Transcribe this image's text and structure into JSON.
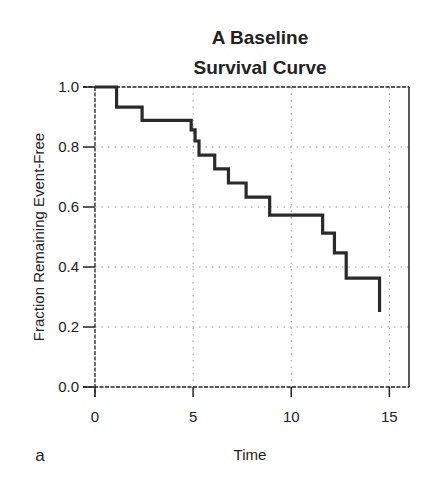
{
  "chart_data": {
    "type": "line",
    "subtype": "step",
    "title": "A Baseline Survival Curve",
    "title_lines": [
      "A Baseline",
      "Survival Curve"
    ],
    "xlabel": "Time",
    "ylabel": "Fraction Remaining Event-Free",
    "panel_label": "a",
    "xlim": [
      0,
      16
    ],
    "ylim": [
      0,
      1.0
    ],
    "x_ticks": [
      0,
      5,
      10,
      15
    ],
    "x_tick_labels": [
      "0",
      "5",
      "10",
      "15"
    ],
    "y_ticks": [
      0.0,
      0.2,
      0.4,
      0.6,
      0.8,
      1.0
    ],
    "y_tick_labels": [
      "0.0",
      "0.2",
      "0.4",
      "0.6",
      "0.8",
      "1.0"
    ],
    "grid": true,
    "grid_style": "dotted",
    "legend": null,
    "series": [
      {
        "name": "Baseline survival",
        "color": "#2a2a2a",
        "step_times": [
          0.0,
          1.1,
          2.4,
          4.9,
          5.1,
          5.3,
          6.1,
          6.8,
          7.7,
          8.9,
          11.6,
          12.2,
          12.8,
          14.5
        ],
        "step_values": [
          1.0,
          0.933,
          0.889,
          0.857,
          0.82,
          0.773,
          0.727,
          0.68,
          0.633,
          0.573,
          0.513,
          0.447,
          0.363,
          0.25
        ]
      }
    ]
  },
  "colors": {
    "ink": "#222222",
    "curve": "#2a2a2a",
    "grid": "#9a9a9a",
    "background": "#ffffff"
  }
}
